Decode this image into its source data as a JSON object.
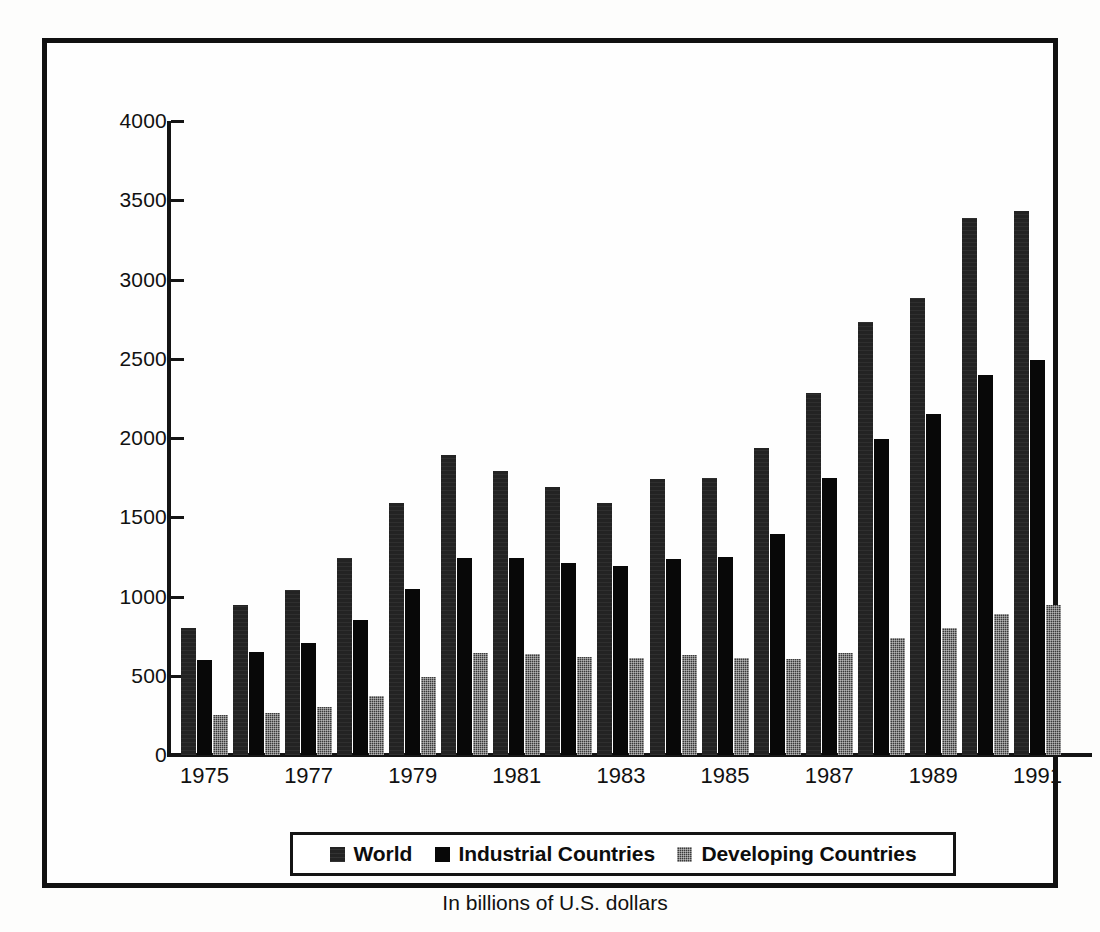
{
  "chart_data": {
    "type": "bar",
    "title": "",
    "subtitle": "In billions of U.S. dollars",
    "xlabel": "",
    "ylabel": "",
    "ylim": [
      0,
      4000
    ],
    "yticks": [
      0,
      500,
      1000,
      1500,
      2000,
      2500,
      3000,
      3500,
      4000
    ],
    "ytick_labels": [
      "0",
      "500",
      "1000",
      "1500",
      "2000",
      "2500",
      "3000",
      "3500",
      "4000"
    ],
    "grid": false,
    "legend_position": "bottom",
    "categories": [
      1975,
      1976,
      1977,
      1978,
      1979,
      1980,
      1981,
      1982,
      1983,
      1984,
      1985,
      1986,
      1987,
      1988,
      1989,
      1990,
      1991
    ],
    "visible_tick_labels": [
      "1975",
      "1977",
      "1979",
      "1981",
      "1983",
      "1985",
      "1987",
      "1989",
      "1991"
    ],
    "series": [
      {
        "name": "World",
        "color": "#232323",
        "pattern": "dark-solid",
        "values": [
          800,
          945,
          1040,
          1240,
          1590,
          1890,
          1790,
          1690,
          1590,
          1740,
          1745,
          1935,
          2285,
          2735,
          2885,
          3385,
          3435
        ]
      },
      {
        "name": "Industrial Countries",
        "color": "#080808",
        "pattern": "solid-black",
        "values": [
          600,
          650,
          705,
          850,
          1045,
          1245,
          1240,
          1210,
          1195,
          1235,
          1250,
          1395,
          1745,
          1995,
          2150,
          2395,
          2495
        ]
      },
      {
        "name": "Developing Countries",
        "color": "#3a3a3a",
        "pattern": "stipple-gray",
        "values": [
          250,
          265,
          300,
          375,
          495,
          645,
          635,
          620,
          615,
          630,
          615,
          605,
          645,
          740,
          800,
          890,
          945
        ]
      }
    ]
  },
  "legend": {
    "items": [
      {
        "label": "World",
        "swatch": "world"
      },
      {
        "label": "Industrial Countries",
        "swatch": "industrial"
      },
      {
        "label": "Developing Countries",
        "swatch": "developing"
      }
    ]
  },
  "footer": {
    "caption": "In billions of U.S. dollars"
  }
}
